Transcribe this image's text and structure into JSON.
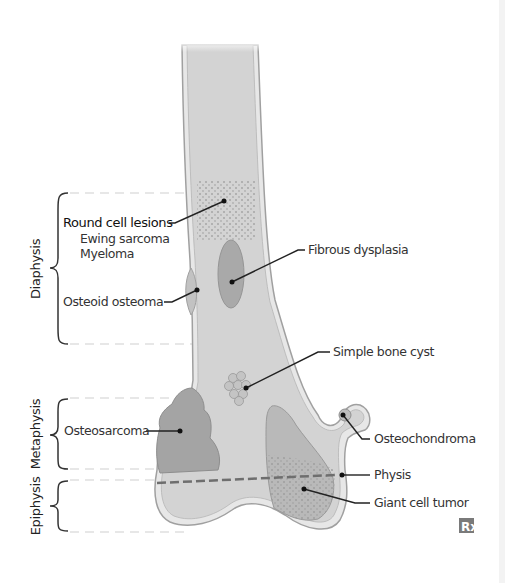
{
  "figure": {
    "regions": [
      {
        "id": "diaphysis",
        "label": "Diaphysis"
      },
      {
        "id": "metaphysis",
        "label": "Metaphysis"
      },
      {
        "id": "epiphysis",
        "label": "Epiphysis"
      }
    ],
    "labels": {
      "round_cell": {
        "title": "Round cell lesions",
        "items": [
          "Ewing sarcoma",
          "Myeloma"
        ]
      },
      "osteoid_osteoma": "Osteoid osteoma",
      "fibrous_dysplasia": "Fibrous dysplasia",
      "simple_bone_cyst": "Simple bone cyst",
      "osteosarcoma": "Osteosarcoma",
      "osteochondroma": "Osteochondroma",
      "physis": "Physis",
      "giant_cell_tumor": "Giant cell tumor"
    },
    "logo": {
      "icon": "rx-icon",
      "text": "Rx"
    },
    "colors": {
      "bone_fill": "#d4d4d4",
      "cortex": "#e8e8e8",
      "outline": "#9a9a9a",
      "lesion": "#a8a8a8",
      "leader": "#222222",
      "dashed_guide": "#c8c8c8"
    }
  }
}
